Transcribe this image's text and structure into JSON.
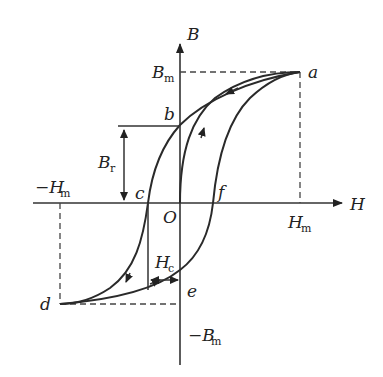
{
  "diagram": {
    "type": "hysteresis-loop",
    "axes": {
      "x_label": "H",
      "y_label": "B",
      "origin_label": "O"
    },
    "points": {
      "a": "a",
      "b": "b",
      "c": "c",
      "d": "d",
      "e": "e",
      "f": "f"
    },
    "labels": {
      "Bm_main": "B",
      "Bm_sub": "m",
      "neg_Bm_main": "−B",
      "neg_Bm_sub": "m",
      "Hm_main": "H",
      "Hm_sub": "m",
      "neg_Hm_main": "−H",
      "neg_Hm_sub": "m",
      "Br_main": "B",
      "Br_sub": "r",
      "Hc_main": "H",
      "Hc_sub": "c"
    },
    "colors": {
      "line": "#2a2a2a",
      "background": "#ffffff"
    }
  }
}
